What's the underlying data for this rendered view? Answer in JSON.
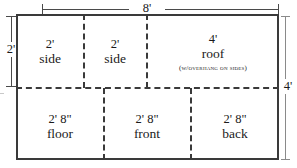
{
  "diagram": {
    "overall": {
      "width_label": "8'",
      "left_height_label": "2'",
      "right_height_label": "4'"
    },
    "cells": [
      {
        "id": "side-1",
        "dimension": "2'",
        "name": "side",
        "note": ""
      },
      {
        "id": "side-2",
        "dimension": "2'",
        "name": "side",
        "note": ""
      },
      {
        "id": "roof",
        "dimension": "4'",
        "name": "roof",
        "note": "(w/overhang on sides)"
      },
      {
        "id": "floor",
        "dimension": "2' 8\"",
        "name": "floor",
        "note": ""
      },
      {
        "id": "front",
        "dimension": "2' 8\"",
        "name": "front",
        "note": ""
      },
      {
        "id": "back",
        "dimension": "2' 8\"",
        "name": "back",
        "note": ""
      }
    ],
    "colors": {
      "outline": "#3a3a3a",
      "divider": "#3a3a3a",
      "dimension_line": "#4a4a4a",
      "text": "#1a1a1a",
      "background": "#ffffff"
    }
  }
}
